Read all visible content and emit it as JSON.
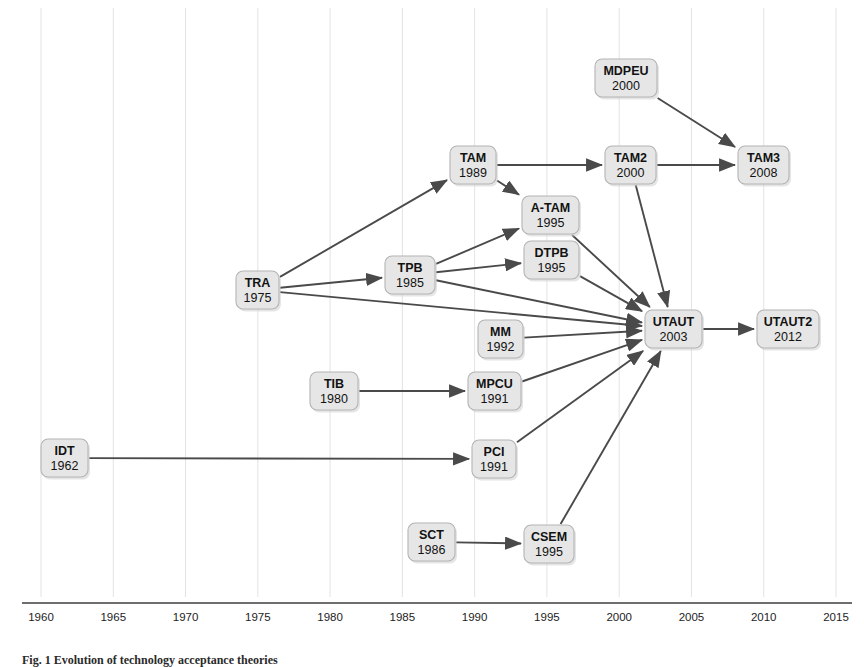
{
  "figure": {
    "caption": "Fig. 1 Evolution of technology acceptance theories"
  },
  "axis": {
    "label": "",
    "ticks": [
      "1960",
      "1965",
      "1970",
      "1975",
      "1980",
      "1985",
      "1990",
      "1995",
      "2000",
      "2005",
      "2010",
      "2015"
    ],
    "tick_values": [
      1960,
      1965,
      1970,
      1975,
      1980,
      1985,
      1990,
      1995,
      2000,
      2005,
      2010,
      2015
    ],
    "range": [
      1960,
      2015
    ],
    "gridlines": true,
    "axis_color": "#3d3d3d",
    "grid_color": "#e3e3e6"
  },
  "style": {
    "node_fill": "#e6e6e6",
    "node_stroke": "#b4b4b4",
    "edge_color": "#4a4a4a",
    "text_color": "#121212"
  },
  "chart_data": {
    "type": "diagram",
    "title": "Evolution of technology acceptance theories",
    "xlabel": "",
    "ylabel": "",
    "xlim": [
      1960,
      2015
    ],
    "nodes": [
      {
        "id": "IDT",
        "label": "IDT",
        "year": "1962",
        "x": 41,
        "y": 439,
        "w": 47,
        "h": 38
      },
      {
        "id": "TRA",
        "label": "TRA",
        "year": "1975",
        "x": 236,
        "y": 271,
        "w": 43,
        "h": 38
      },
      {
        "id": "TIB",
        "label": "TIB",
        "year": "1980",
        "x": 310,
        "y": 372,
        "w": 48,
        "h": 38
      },
      {
        "id": "TPB",
        "label": "TPB",
        "year": "1985",
        "x": 385,
        "y": 256,
        "w": 50,
        "h": 38
      },
      {
        "id": "SCT",
        "label": "SCT",
        "year": "1986",
        "x": 408,
        "y": 523,
        "w": 47,
        "h": 38
      },
      {
        "id": "TAM",
        "label": "TAM",
        "year": "1989",
        "x": 450,
        "y": 146,
        "w": 46,
        "h": 38
      },
      {
        "id": "MPCU",
        "label": "MPCU",
        "year": "1991",
        "x": 468,
        "y": 372,
        "w": 53,
        "h": 38
      },
      {
        "id": "PCI",
        "label": "PCI",
        "year": "1991",
        "x": 472,
        "y": 440,
        "w": 44,
        "h": 38
      },
      {
        "id": "MM",
        "label": "MM",
        "year": "1992",
        "x": 478,
        "y": 320,
        "w": 45,
        "h": 38
      },
      {
        "id": "A-TAM",
        "label": "A-TAM",
        "year": "1995",
        "x": 522,
        "y": 196,
        "w": 57,
        "h": 38
      },
      {
        "id": "DTPB",
        "label": "DTPB",
        "year": "1995",
        "x": 524,
        "y": 241,
        "w": 55,
        "h": 38
      },
      {
        "id": "CSEM",
        "label": "CSEM",
        "year": "1995",
        "x": 524,
        "y": 525,
        "w": 50,
        "h": 38
      },
      {
        "id": "MDPEU",
        "label": "MDPEU",
        "year": "2000",
        "x": 595,
        "y": 59,
        "w": 62,
        "h": 38
      },
      {
        "id": "TAM2",
        "label": "TAM2",
        "year": "2000",
        "x": 605,
        "y": 146,
        "w": 51,
        "h": 38
      },
      {
        "id": "UTAUT",
        "label": "UTAUT",
        "year": "2003",
        "x": 645,
        "y": 310,
        "w": 57,
        "h": 38
      },
      {
        "id": "TAM3",
        "label": "TAM3",
        "year": "2008",
        "x": 738,
        "y": 146,
        "w": 51,
        "h": 38
      },
      {
        "id": "UTAUT2",
        "label": "UTAUT2",
        "year": "2012",
        "x": 757,
        "y": 310,
        "w": 62,
        "h": 38
      }
    ],
    "edges": [
      {
        "from": "TRA",
        "to": "TAM"
      },
      {
        "from": "TRA",
        "to": "TPB"
      },
      {
        "from": "TRA",
        "to": "UTAUT"
      },
      {
        "from": "TPB",
        "to": "A-TAM"
      },
      {
        "from": "TPB",
        "to": "DTPB"
      },
      {
        "from": "TPB",
        "to": "UTAUT"
      },
      {
        "from": "TAM",
        "to": "A-TAM"
      },
      {
        "from": "TAM",
        "to": "TAM2"
      },
      {
        "from": "TAM2",
        "to": "TAM3"
      },
      {
        "from": "TAM2",
        "to": "UTAUT"
      },
      {
        "from": "MDPEU",
        "to": "TAM3"
      },
      {
        "from": "A-TAM",
        "to": "UTAUT"
      },
      {
        "from": "DTPB",
        "to": "UTAUT"
      },
      {
        "from": "MM",
        "to": "UTAUT"
      },
      {
        "from": "MPCU",
        "to": "UTAUT"
      },
      {
        "from": "PCI",
        "to": "UTAUT"
      },
      {
        "from": "CSEM",
        "to": "UTAUT"
      },
      {
        "from": "TIB",
        "to": "MPCU"
      },
      {
        "from": "IDT",
        "to": "PCI"
      },
      {
        "from": "SCT",
        "to": "CSEM"
      },
      {
        "from": "UTAUT",
        "to": "UTAUT2"
      }
    ]
  }
}
